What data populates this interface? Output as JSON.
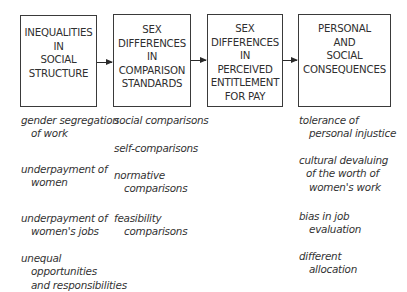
{
  "boxes": [
    {
      "lines": [
        "INEQUALITIES",
        "IN",
        "SOCIAL",
        "STRUCTURE"
      ]
    },
    {
      "lines": [
        "SEX",
        "DIFFERENCES",
        "IN",
        "COMPARISON",
        "STANDARDS"
      ]
    },
    {
      "lines": [
        "SEX",
        "DIFFERENCES",
        "IN",
        "PERCEIVED",
        "ENTITLEMENT",
        "FOR PAY"
      ]
    },
    {
      "lines": [
        "PERSONAL",
        "AND",
        "SOCIAL",
        "CONSEQUENCES"
      ]
    }
  ],
  "columns": [
    {
      "items": [
        {
          "lines": [
            "gender segregation",
            "of work"
          ]
        },
        {
          "lines": [
            "underpayment of",
            "women"
          ]
        },
        {
          "lines": [
            "underpayment of",
            "women's jobs"
          ]
        },
        {
          "lines": [
            "unequal",
            "opportunities",
            "and responsibilities"
          ]
        }
      ]
    },
    {
      "items": [
        {
          "lines": [
            "social comparisons"
          ]
        },
        {
          "lines": [
            "self-comparisons"
          ]
        },
        {
          "lines": [
            "normative",
            "comparisons"
          ]
        },
        {
          "lines": [
            "feasibility",
            "comparisons"
          ]
        }
      ]
    },
    {
      "items": [
        {
          "lines": [
            "tolerance of",
            "personal injustice"
          ]
        },
        {
          "lines": [
            "cultural devaluing",
            "of the worth of",
            "women's work"
          ]
        },
        {
          "lines": [
            "bias in job",
            "evaluation"
          ]
        },
        {
          "lines": [
            "different",
            "allocation"
          ]
        }
      ]
    }
  ],
  "arrows": [
    {
      "from": "INEQUALITIES IN SOCIAL STRUCTURE",
      "to": "SEX DIFFERENCES IN COMPARISON STANDARDS"
    },
    {
      "from": "SEX DIFFERENCES IN COMPARISON STANDARDS",
      "to": "SEX DIFFERENCES IN PERCEIVED ENTITLEMENT FOR PAY"
    },
    {
      "from": "SEX DIFFERENCES IN PERCEIVED ENTITLEMENT FOR PAY",
      "to": "PERSONAL AND SOCIAL CONSEQUENCES"
    }
  ]
}
